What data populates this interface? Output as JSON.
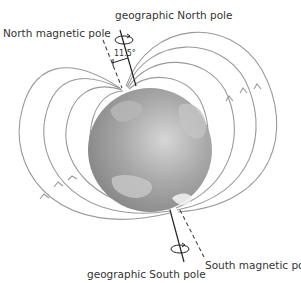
{
  "diagram": {
    "title_partial": "",
    "labels": {
      "geographic_north": "geographic North pole",
      "north_magnetic": "North magnetic pole",
      "angle": "11.5°",
      "geographic_south": "geographic South pole",
      "south_magnetic": "South magnetic pole"
    },
    "colors": {
      "field_line": "#9a9a9a",
      "axis": "#222222",
      "globe_dark": "#8a8a8a",
      "globe_light": "#d8d8d8",
      "text": "#333333"
    }
  }
}
